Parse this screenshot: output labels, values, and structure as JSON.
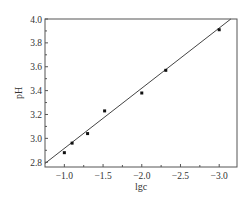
{
  "chart_data": {
    "type": "scatter",
    "title": "",
    "xlabel": "lgc",
    "ylabel": "pH",
    "xlim": [
      -0.75,
      -3.23
    ],
    "ylim": [
      2.76,
      4.0
    ],
    "x_ticks": [
      -1.0,
      -1.5,
      -2.0,
      -2.5,
      -3.0
    ],
    "x_tick_labels": [
      "-1.0",
      "-1.5",
      "-2.0",
      "-2.5",
      "-3.0"
    ],
    "y_ticks": [
      2.8,
      3.0,
      3.2,
      3.4,
      3.6,
      3.8,
      4.0
    ],
    "y_tick_labels": [
      "2.8",
      "3.0",
      "3.2",
      "3.4",
      "3.6",
      "3.8",
      "4.0"
    ],
    "grid": false,
    "legend": null,
    "series": [
      {
        "name": "measured",
        "style": "points",
        "x": [
          -1.0,
          -1.1,
          -1.3,
          -1.52,
          -2.0,
          -2.31,
          -3.0
        ],
        "y": [
          2.88,
          2.96,
          3.04,
          3.23,
          3.38,
          3.57,
          3.91
        ]
      },
      {
        "name": "linear fit",
        "style": "line",
        "x": [
          -0.75,
          -3.15
        ],
        "y": [
          2.79,
          4.0
        ]
      }
    ]
  }
}
